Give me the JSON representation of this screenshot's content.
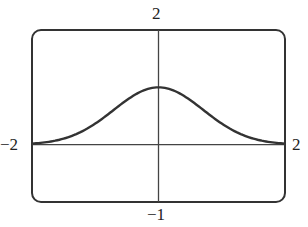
{
  "chart_data": {
    "type": "line",
    "title": "",
    "xlabel": "",
    "ylabel": "",
    "xlim": [
      -2,
      2
    ],
    "ylim": [
      -1,
      2
    ],
    "grid": false,
    "legend": null,
    "window_labels": {
      "ymax": "2",
      "ymin": "−1",
      "xmin": "−2",
      "xmax": "2"
    },
    "series": [
      {
        "name": "curve",
        "description": "bell-shaped curve, approx y = e^(-x^2), peak 1 at x = 0",
        "x": [
          -2,
          -1.75,
          -1.5,
          -1.25,
          -1,
          -0.75,
          -0.5,
          -0.25,
          0,
          0.25,
          0.5,
          0.75,
          1,
          1.25,
          1.5,
          1.75,
          2
        ],
        "y": [
          0.02,
          0.05,
          0.11,
          0.21,
          0.37,
          0.57,
          0.78,
          0.94,
          1.0,
          0.94,
          0.78,
          0.57,
          0.37,
          0.21,
          0.11,
          0.05,
          0.02
        ]
      }
    ],
    "style": {
      "stroke_color": "#333333",
      "frame_color": "#333333",
      "axis_color": "#444444"
    }
  }
}
